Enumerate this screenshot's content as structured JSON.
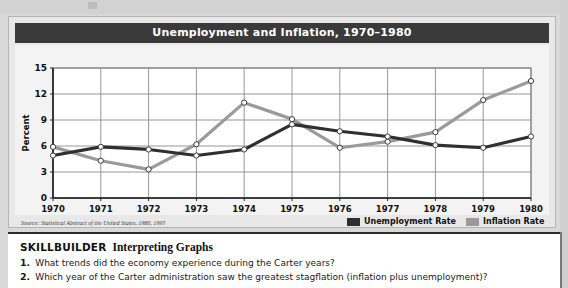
{
  "figure": {
    "title": "Unemployment and Inflation, 1970–1980",
    "source_note": "Source: Statistical Abstract of the United States, 1980, 1995"
  },
  "legend": {
    "position": "bottom-right",
    "entries": [
      {
        "label": "Unemployment Rate",
        "color": "#2f2f2f"
      },
      {
        "label": "Inflation Rate",
        "color": "#9a9a9a"
      }
    ]
  },
  "skillbuilder": {
    "heading_strong": "SKILLBUILDER",
    "heading_sub": "Interpreting Graphs",
    "questions": [
      {
        "number": "1.",
        "text": "What trends did the economy experience during the Carter years?"
      },
      {
        "number": "2.",
        "text": "Which year of the Carter administration saw the greatest stagflation (inflation plus unemployment)?"
      }
    ]
  },
  "chart_data": {
    "type": "line",
    "title": "Unemployment and Inflation, 1970–1980",
    "xlabel": "",
    "ylabel": "Percent",
    "ylim": [
      0,
      15
    ],
    "yticks": [
      0,
      3,
      6,
      9,
      12,
      15
    ],
    "grid": true,
    "categories": [
      "1970",
      "1971",
      "1972",
      "1973",
      "1974",
      "1975",
      "1976",
      "1977",
      "1978",
      "1979",
      "1980"
    ],
    "x": [
      1970,
      1971,
      1972,
      1973,
      1974,
      1975,
      1976,
      1977,
      1978,
      1979,
      1980
    ],
    "series": [
      {
        "name": "Unemployment Rate",
        "color": "#2f2f2f",
        "values": [
          4.9,
          5.9,
          5.6,
          4.9,
          5.6,
          8.5,
          7.7,
          7.1,
          6.1,
          5.8,
          7.1
        ]
      },
      {
        "name": "Inflation Rate",
        "color": "#9a9a9a",
        "values": [
          5.9,
          4.3,
          3.3,
          6.2,
          11.0,
          9.1,
          5.8,
          6.5,
          7.6,
          11.3,
          13.5
        ]
      }
    ]
  }
}
